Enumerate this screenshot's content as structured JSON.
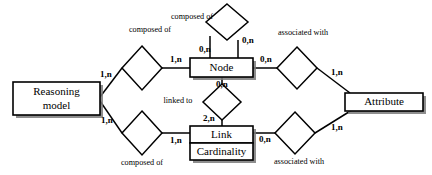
{
  "diagram": {
    "type": "entity-relationship",
    "entities": [
      {
        "id": "reasoning-model",
        "label_line1": "Reasoning",
        "label_line2": "model"
      },
      {
        "id": "node",
        "label_line1": "Node"
      },
      {
        "id": "link",
        "label_line1": "Link",
        "label_line2": "Cardinality"
      },
      {
        "id": "attribute",
        "label_line1": "Attribute"
      }
    ],
    "relationships": [
      {
        "id": "composed-of-top",
        "label": "composed of"
      },
      {
        "id": "composed-of-upper-left",
        "label": "composed of"
      },
      {
        "id": "composed-of-lower-left",
        "label": "composed of"
      },
      {
        "id": "linked-to",
        "label": "linked to"
      },
      {
        "id": "associated-with-upper",
        "label": "associated with"
      },
      {
        "id": "associated-with-lower",
        "label": "associated with"
      }
    ],
    "cardinalities": {
      "node_self_left": "0,n",
      "node_self_right": "0,n",
      "node_top": "0,n",
      "node_bottom": "0,n",
      "node_to_composed_left": "1,n",
      "node_to_assoc_right": "0,n",
      "rm_to_composed_upper": "1,n",
      "rm_to_composed_lower": "1,n",
      "link_to_composed_left": "1,n",
      "link_top": "2,n",
      "link_to_assoc_right": "0,n",
      "attribute_upper": "1,n",
      "attribute_lower": "1,n"
    }
  }
}
